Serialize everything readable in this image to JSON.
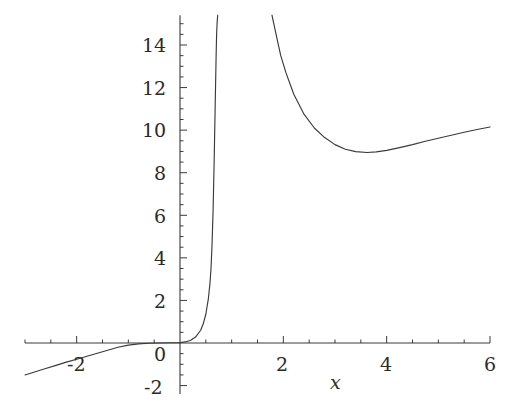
{
  "chart_data": {
    "type": "line",
    "title": "",
    "subtitle": "",
    "xlabel": "x",
    "ylabel": "",
    "grid": false,
    "legend": null,
    "xlim": [
      -3.0,
      6.0
    ],
    "ylim": [
      -2.4,
      15.4
    ],
    "x_ticks_major": [
      -2,
      0,
      2,
      4,
      6
    ],
    "x_tick_labels": [
      "-2",
      "0",
      "2",
      "4",
      "6"
    ],
    "y_ticks_major": [
      -2,
      0,
      2,
      4,
      6,
      8,
      10,
      12,
      14
    ],
    "y_tick_labels": [
      "-2",
      "0",
      "2",
      "4",
      "6",
      "8",
      "10",
      "12",
      "14"
    ],
    "minor_tick_step_x": 0.5,
    "minor_tick_step_y": 0.5,
    "axis_color": "#3a3a3a",
    "curve_color": "#3a3a3a",
    "background_color": "#ffffff",
    "vertical_asymptote_x": 0.75,
    "annotations": [],
    "series": [
      {
        "name": "branch-left",
        "comment": "rises from lower-left, crosses x-axis near x=-1.2, blows up at the asymptote x~0.75",
        "x": [
          -3.0,
          -2.8,
          -2.6,
          -2.4,
          -2.2,
          -2.0,
          -1.8,
          -1.6,
          -1.4,
          -1.2,
          -1.0,
          -0.8,
          -0.6,
          -0.4,
          -0.2,
          0.0,
          0.1,
          0.2,
          0.3,
          0.4,
          0.45,
          0.5,
          0.55,
          0.58,
          0.6,
          0.62,
          0.64,
          0.66,
          0.68,
          0.7,
          0.71,
          0.72,
          0.73
        ],
        "y": [
          -1.5,
          -1.35,
          -1.2,
          -1.05,
          -0.9,
          -0.76,
          -0.62,
          -0.48,
          -0.34,
          -0.2,
          -0.1,
          -0.04,
          -0.01,
          0.0,
          0.01,
          0.02,
          0.05,
          0.12,
          0.28,
          0.6,
          0.9,
          1.35,
          2.1,
          2.8,
          3.5,
          4.6,
          6.2,
          8.4,
          11.0,
          13.6,
          14.6,
          15.1,
          15.4
        ]
      },
      {
        "name": "branch-right",
        "comment": "falls from +infinity just right of the asymptote, minimum ~(3.6, 8.95), rises to ~10.15 at x=6",
        "x": [
          1.78,
          1.85,
          1.95,
          2.05,
          2.2,
          2.4,
          2.6,
          2.8,
          3.0,
          3.2,
          3.4,
          3.62,
          3.8,
          4.0,
          4.25,
          4.5,
          4.75,
          5.0,
          5.25,
          5.5,
          5.75,
          6.0
        ],
        "y": [
          15.4,
          14.6,
          13.5,
          12.7,
          11.7,
          10.75,
          10.1,
          9.65,
          9.32,
          9.1,
          8.99,
          8.95,
          8.98,
          9.05,
          9.18,
          9.32,
          9.48,
          9.62,
          9.76,
          9.9,
          10.03,
          10.15
        ]
      }
    ]
  },
  "axis_labels": {
    "x_axis_name": "x"
  }
}
